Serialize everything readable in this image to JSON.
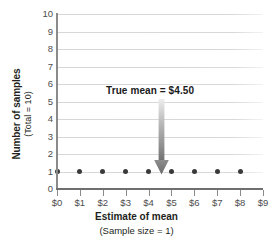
{
  "chart_data": {
    "type": "scatter",
    "title": "",
    "xlabel": "Estimate of mean",
    "xlabel_sub": "(Sample size = 1)",
    "ylabel": "Number of samples",
    "ylabel_sub": "(Total = 10)",
    "x": [
      0,
      1,
      2,
      3,
      4,
      5,
      6,
      7,
      8
    ],
    "values": [
      1,
      1,
      1,
      1,
      1,
      1,
      1,
      1,
      1
    ],
    "xlim": [
      0,
      9
    ],
    "ylim": [
      0,
      10
    ],
    "x_tick_labels": [
      "$0",
      "$1",
      "$2",
      "$3",
      "$4",
      "$5",
      "$6",
      "$7",
      "$8",
      "$9"
    ],
    "x_tick_values": [
      0,
      1,
      2,
      3,
      4,
      5,
      6,
      7,
      8,
      9
    ],
    "y_tick_labels": [
      "10",
      "9",
      "8",
      "7",
      "6",
      "5",
      "4",
      "3",
      "2",
      "1",
      "0"
    ],
    "y_tick_values": [
      10,
      9,
      8,
      7,
      6,
      5,
      4,
      3,
      2,
      1,
      0
    ],
    "grid": true,
    "grid_axis": "y",
    "legend": false,
    "annotations": [
      {
        "text": "True mean  =  $4.50",
        "x": 4.5,
        "y_text": 5.4,
        "y_arrow_tip": 1.2,
        "type": "arrow-down"
      }
    ],
    "colors": {
      "marker": "#3a3a3a",
      "gridline": "#d7d7d7",
      "axis": "#8a8a8a",
      "arrow_top": "#e8e8e8",
      "arrow_bottom": "#6e6e6e",
      "text": "#231f20",
      "tick_text": "#4d4d4d",
      "background": "#ffffff"
    }
  }
}
